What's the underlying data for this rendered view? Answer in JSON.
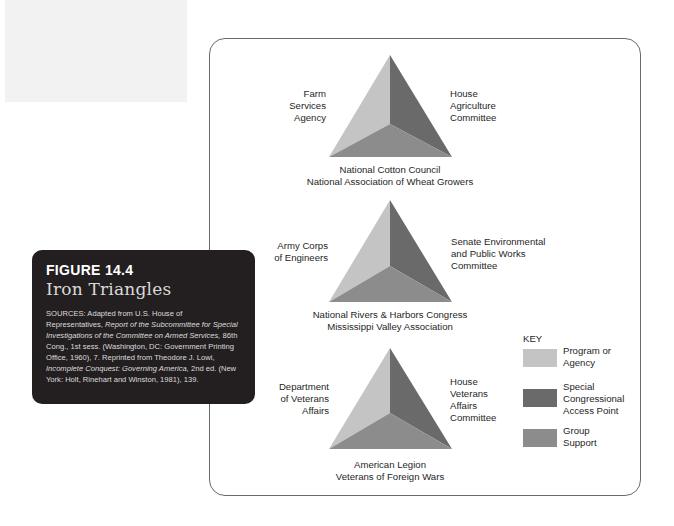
{
  "figure": {
    "number": "FIGURE 14.4",
    "title": "Iron Triangles",
    "sources_prefix": "SOURCES: Adapted from U.S. House of Representatives,",
    "sources_italic_1": "Report of the Subcommittee for Special Investigations of the Committee on Armed Services,",
    "sources_mid": "86th Cong., 1st sess. (Washington, DC: Government Printing Office, 1960), 7. Reprinted from Theodore J. Lowi,",
    "sources_italic_2": "Incomplete Conquest: Governing America,",
    "sources_suffix": "2nd ed. (New York: Holt, Rinehart and Winston, 1981), 139."
  },
  "colors": {
    "program_agency": "#c4c4c4",
    "congressional": "#6a6a6a",
    "group_support": "#8c8c8c",
    "caption_bg": "#231f20",
    "border": "#6a6a6a"
  },
  "triangles": [
    {
      "left_label": [
        "Farm",
        "Services",
        "Agency"
      ],
      "right_label": [
        "House",
        "Agriculture",
        "Committee"
      ],
      "bottom_label": [
        "National Cotton Council",
        "National Association of Wheat Growers"
      ]
    },
    {
      "left_label": [
        "Army Corps",
        "of Engineers"
      ],
      "right_label": [
        "Senate Environmental",
        "and Public Works",
        "Committee"
      ],
      "bottom_label": [
        "National Rivers & Harbors Congress",
        "Mississippi Valley Association"
      ]
    },
    {
      "left_label": [
        "Department",
        "of Veterans",
        "Affairs"
      ],
      "right_label": [
        "House",
        "Veterans",
        "Affairs",
        "Committee"
      ],
      "bottom_label": [
        "American Legion",
        "Veterans of Foreign Wars"
      ]
    }
  ],
  "key": {
    "title": "KEY",
    "items": [
      {
        "label": [
          "Program or",
          "Agency"
        ],
        "color": "#c4c4c4"
      },
      {
        "label": [
          "Special",
          "Congressional",
          "Access Point"
        ],
        "color": "#6a6a6a"
      },
      {
        "label": [
          "Group",
          "Support"
        ],
        "color": "#8c8c8c"
      }
    ]
  }
}
